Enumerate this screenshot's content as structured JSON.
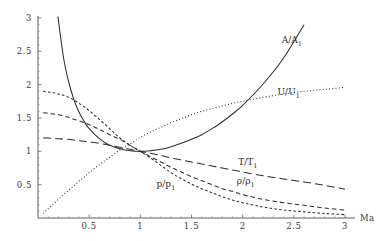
{
  "chart_data": {
    "type": "line",
    "title": "",
    "subtitle": "",
    "xlabel": "Ma",
    "ylabel": "",
    "xlim": [
      0,
      3
    ],
    "ylim": [
      0,
      3
    ],
    "grid": false,
    "legend_position": "inline-annotations",
    "xticks": [
      "0.5",
      "1",
      "1.5",
      "2",
      "2.5",
      "3"
    ],
    "xtick_values": [
      0.5,
      1,
      1.5,
      2,
      2.5,
      3
    ],
    "yticks": [
      "0.5",
      "1",
      "1.5",
      "2",
      "2.5",
      "3"
    ],
    "ytick_values": [
      0.5,
      1,
      1.5,
      2,
      2.5,
      3
    ],
    "x": [
      0.05,
      0.1,
      0.15,
      0.2,
      0.25,
      0.3,
      0.35,
      0.4,
      0.45,
      0.5,
      0.6,
      0.7,
      0.8,
      0.9,
      1.0,
      1.1,
      1.2,
      1.3,
      1.4,
      1.5,
      1.6,
      1.7,
      1.8,
      1.9,
      2.0,
      2.2,
      2.4,
      2.6,
      2.8,
      3.0
    ],
    "series": [
      {
        "name": "A/A1",
        "label": "A/A",
        "sub": "1",
        "style": "solid",
        "dasharray": "",
        "values": [
          11.59,
          5.82,
          3.91,
          2.96,
          2.4,
          2.04,
          1.78,
          1.59,
          1.45,
          1.34,
          1.19,
          1.09,
          1.04,
          1.01,
          1.0,
          1.01,
          1.03,
          1.07,
          1.12,
          1.18,
          1.25,
          1.34,
          1.44,
          1.56,
          1.69,
          2.01,
          2.4,
          2.9,
          3.5,
          4.23
        ],
        "label_xy": [
          2.48,
          2.62
        ]
      },
      {
        "name": "U/U1",
        "label": "U/U",
        "sub": "1",
        "style": "dotted",
        "dasharray": "1,2.2",
        "values": [
          0.055,
          0.11,
          0.165,
          0.219,
          0.273,
          0.326,
          0.378,
          0.43,
          0.48,
          0.53,
          0.625,
          0.715,
          0.799,
          0.875,
          0.946,
          1.01,
          1.069,
          1.122,
          1.17,
          1.213,
          1.253,
          1.289,
          1.321,
          1.35,
          1.376,
          1.422,
          1.459,
          1.49,
          1.515,
          1.536
        ],
        "values_scaled": [
          0.07,
          0.14,
          0.21,
          0.28,
          0.35,
          0.42,
          0.48,
          0.55,
          0.61,
          0.68,
          0.8,
          0.91,
          1.02,
          1.11,
          1.21,
          1.29,
          1.36,
          1.43,
          1.49,
          1.55,
          1.6,
          1.64,
          1.68,
          1.72,
          1.75,
          1.81,
          1.86,
          1.9,
          1.93,
          1.96
        ],
        "label_xy": [
          2.45,
          1.85
        ]
      },
      {
        "name": "T/T1",
        "label": "T/T",
        "sub": "1",
        "style": "long-dash",
        "dasharray": "8,4",
        "values": [
          1.1995,
          1.1976,
          1.1946,
          1.1905,
          1.1852,
          1.1789,
          1.1716,
          1.1633,
          1.1541,
          1.1441,
          1.1216,
          1.0963,
          1.069,
          1.0403,
          1.0,
          0.9823,
          0.9524,
          0.9231,
          0.8942,
          0.8658,
          0.8383,
          0.8115,
          0.7856,
          0.7607,
          0.7368,
          0.692,
          0.6513,
          0.6142,
          0.5804,
          0.5495
        ],
        "values_scaled": [
          1.2,
          1.2,
          1.19,
          1.19,
          1.185,
          1.18,
          1.17,
          1.16,
          1.15,
          1.14,
          1.12,
          1.09,
          1.06,
          1.03,
          1.0,
          0.97,
          0.94,
          0.9,
          0.87,
          0.84,
          0.81,
          0.78,
          0.75,
          0.72,
          0.69,
          0.635,
          0.585,
          0.54,
          0.49,
          0.43
        ],
        "label_xy": [
          2.05,
          0.8
        ]
      },
      {
        "name": "rho/rho1",
        "label": "ρ/ρ",
        "sub": "1",
        "style": "medium-dash",
        "dasharray": "4.5,3",
        "values": [
          1.5787,
          1.5725,
          1.5623,
          1.5481,
          1.5302,
          1.5088,
          1.4842,
          1.4569,
          1.4272,
          1.3955,
          1.3273,
          1.2551,
          1.1818,
          1.1098,
          1.0,
          0.9742,
          0.9141,
          0.8582,
          0.8063,
          0.7584,
          0.7142,
          0.6734,
          0.636,
          0.6015,
          0.5699,
          0.5144,
          0.4677,
          0.4281,
          0.3943,
          0.3653
        ],
        "values_scaled": [
          1.58,
          1.57,
          1.56,
          1.55,
          1.53,
          1.51,
          1.48,
          1.46,
          1.43,
          1.4,
          1.33,
          1.25,
          1.18,
          1.09,
          1.0,
          0.92,
          0.84,
          0.76,
          0.69,
          0.62,
          0.56,
          0.5,
          0.44,
          0.4,
          0.35,
          0.28,
          0.23,
          0.19,
          0.15,
          0.12
        ],
        "label_xy": [
          2.03,
          0.51
        ]
      },
      {
        "name": "p/p1",
        "label": "p/p",
        "sub": "1",
        "style": "short-dash",
        "dasharray": "2.6,2.2",
        "values": [
          1.8928,
          1.8804,
          1.8599,
          1.8316,
          1.7959,
          1.7534,
          1.7046,
          1.6503,
          1.5912,
          1.5282,
          1.3946,
          1.2559,
          1.1175,
          0.9844,
          1.0,
          0.9124,
          0.8015,
          0.7038,
          0.618,
          0.5429,
          0.4774,
          0.4204,
          0.3708,
          0.3276,
          0.29,
          0.2283,
          0.1813,
          0.1449,
          0.1166,
          0.0944
        ],
        "values_scaled": [
          1.9,
          1.89,
          1.88,
          1.86,
          1.84,
          1.81,
          1.77,
          1.72,
          1.67,
          1.61,
          1.48,
          1.34,
          1.2,
          1.09,
          1.0,
          0.9,
          0.79,
          0.68,
          0.59,
          0.51,
          0.44,
          0.38,
          0.32,
          0.27,
          0.23,
          0.165,
          0.12,
          0.092,
          0.068,
          0.05
        ],
        "label_xy": [
          1.25,
          0.46
        ]
      }
    ],
    "notes": {
      "crossing_point_x": 1.0,
      "crossing_point_y": 1.0,
      "axis_color": "#4d4d4d",
      "curve_color": "#2e2e2e"
    }
  }
}
